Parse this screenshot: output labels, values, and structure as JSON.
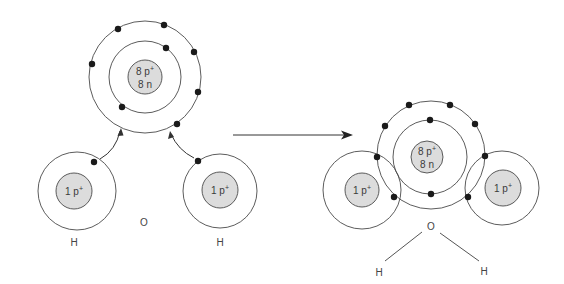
{
  "diagram": {
    "colors": {
      "background": "#ffffff",
      "orbit": "#4a4a4a",
      "nucleus_fill": "#dcdcdc",
      "electron": "#1a1a1a",
      "text": "#3a3a3a"
    },
    "before": {
      "oxygen": {
        "symbol_label": "O",
        "nucleus_line1": "8 p",
        "nucleus_line1_sup": "+",
        "nucleus_line2": "8 n",
        "inner_shell_electrons": 2,
        "outer_shell_electrons": 6
      },
      "hydrogen_left": {
        "symbol_label": "H",
        "nucleus_line1": "1 p",
        "nucleus_line1_sup": "+",
        "electrons": 1
      },
      "hydrogen_right": {
        "symbol_label": "H",
        "nucleus_line1": "1 p",
        "nucleus_line1_sup": "+",
        "electrons": 1
      }
    },
    "reaction_arrow": "arrow-right-icon",
    "after": {
      "oxygen": {
        "nucleus_line1": "8 p",
        "nucleus_line1_sup": "+",
        "nucleus_line2": "8 n",
        "inner_shell_electrons": 2,
        "outer_shell_electrons": 8
      },
      "hydrogen_left": {
        "nucleus_line1": "1 p",
        "nucleus_line1_sup": "+"
      },
      "hydrogen_right": {
        "nucleus_line1": "1 p",
        "nucleus_line1_sup": "+"
      },
      "structural_formula": {
        "center": "O",
        "left": "H",
        "right": "H"
      }
    }
  }
}
